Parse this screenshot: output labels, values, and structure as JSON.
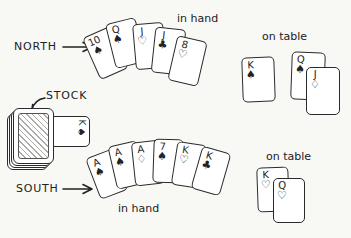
{
  "colors": {
    "ink": "#222222",
    "paper": "#f8f8f5",
    "card_face": "#ffffff"
  },
  "labels": {
    "north": "NORTH",
    "south": "SOUTH",
    "stock": "STOCK",
    "north_hand_caption": "in hand",
    "south_hand_caption": "in hand",
    "north_table_caption": "on table",
    "south_table_caption": "on table"
  },
  "icons": {
    "north_arrow": "right-arrow",
    "south_arrow": "right-arrow",
    "stock_arrow": "down-left-curved-arrow",
    "stock_pile": "face-down-card-pile"
  },
  "suit_symbols": {
    "spade": "♠",
    "club": "♣",
    "heart": "♡",
    "diamond": "♢"
  },
  "card_groups": {
    "north_hand": [
      {
        "rank": "10",
        "suit": "spade"
      },
      {
        "rank": "Q",
        "suit": "spade"
      },
      {
        "rank": "J",
        "suit": "heart"
      },
      {
        "rank": "J",
        "suit": "club"
      },
      {
        "rank": "8",
        "suit": "heart"
      }
    ],
    "north_table_single": [
      {
        "rank": "K",
        "suit": "spade"
      }
    ],
    "north_table_pair": [
      {
        "rank": "Q",
        "suit": "spade"
      },
      {
        "rank": "J",
        "suit": "diamond"
      }
    ],
    "stock_upcard": [
      {
        "rank": "K",
        "suit": "spade"
      }
    ],
    "south_hand": [
      {
        "rank": "A",
        "suit": "spade"
      },
      {
        "rank": "A",
        "suit": "spade"
      },
      {
        "rank": "A",
        "suit": "diamond"
      },
      {
        "rank": "7",
        "suit": "spade"
      },
      {
        "rank": "K",
        "suit": "heart"
      },
      {
        "rank": "K",
        "suit": "club"
      }
    ],
    "south_table_pair": [
      {
        "rank": "K",
        "suit": "heart"
      },
      {
        "rank": "Q",
        "suit": "heart"
      }
    ]
  }
}
